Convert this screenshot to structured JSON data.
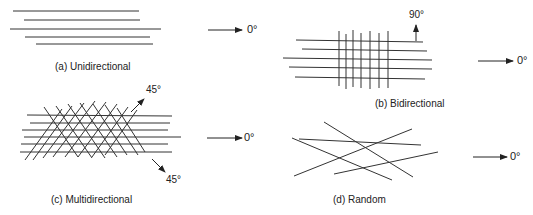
{
  "panels": {
    "a": {
      "caption": "(a)  Unidirectional",
      "arrow_label": "0°"
    },
    "b": {
      "caption": "(b)  Bidirectional",
      "arrow_label": "0°",
      "vertical_label": "90°"
    },
    "c": {
      "caption": "(c)  Multidirectional",
      "arrow_label": "0°",
      "up_label": "45°",
      "down_label": "45°"
    },
    "d": {
      "caption": "(d)  Random",
      "arrow_label": "0°"
    }
  },
  "colors": {
    "line": "#333333",
    "background": "#ffffff"
  }
}
